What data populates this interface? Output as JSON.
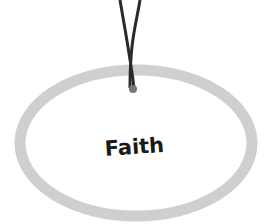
{
  "tag": {
    "label": "Faith",
    "ring_color": "#cfcfcf",
    "string_color": "#2a2a2a",
    "knot_color": "#777777",
    "icon": "hanging-tag-ellipse"
  }
}
